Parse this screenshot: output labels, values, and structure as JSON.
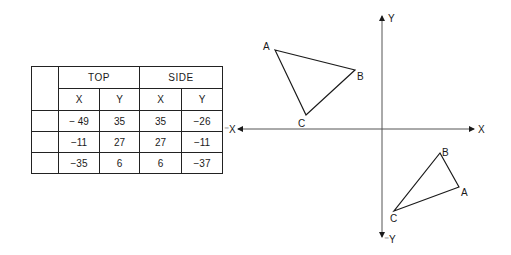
{
  "table": {
    "groups": [
      "TOP",
      "SIDE"
    ],
    "subheaders": [
      "X",
      "Y",
      "X",
      "Y"
    ],
    "rows": [
      {
        "label": "",
        "values": [
          "− 49",
          "35",
          "35",
          "−26"
        ]
      },
      {
        "label": "",
        "values": [
          "−11",
          "27",
          "27",
          "−11"
        ]
      },
      {
        "label": "",
        "values": [
          "−35",
          "6",
          "6",
          "−37"
        ]
      }
    ]
  },
  "axes": {
    "pos_x_label": "X",
    "neg_x_label": "⁻X",
    "pos_y_label": "Y",
    "neg_y_label": "⁻Y",
    "origin": [
      382,
      129
    ],
    "x_range_px": [
      236,
      476
    ],
    "y_range_px": [
      14,
      238
    ]
  },
  "triangles": {
    "top_view": {
      "vertices": [
        {
          "label": "A",
          "x": 275,
          "y": 50
        },
        {
          "label": "B",
          "x": 355,
          "y": 70
        },
        {
          "label": "C",
          "x": 306,
          "y": 115
        }
      ]
    },
    "side_view": {
      "vertices": [
        {
          "label": "A",
          "x": 459,
          "y": 187
        },
        {
          "label": "B",
          "x": 440,
          "y": 153
        },
        {
          "label": "C",
          "x": 394,
          "y": 211
        }
      ]
    }
  },
  "colors": {
    "ink": "#1a1a1a",
    "axis": "#555555",
    "background": "#ffffff"
  }
}
